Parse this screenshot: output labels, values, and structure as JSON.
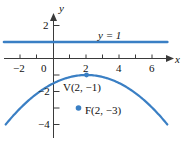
{
  "figure": {
    "colors": {
      "curve": "#3a7fc4",
      "line": "#3a7fc4",
      "point": "#3a7fc4",
      "axis": "#3a3a3a",
      "text": "#111111",
      "background": "#ffffff"
    }
  },
  "axes": {
    "x_axis_label": "x",
    "y_axis_label": "y",
    "x_ticks": [
      {
        "value": -2,
        "label": "−2"
      },
      {
        "value": -1,
        "label": ""
      },
      {
        "value": 0,
        "label": "0"
      },
      {
        "value": 1,
        "label": ""
      },
      {
        "value": 2,
        "label": "2"
      },
      {
        "value": 3,
        "label": ""
      },
      {
        "value": 4,
        "label": "4"
      },
      {
        "value": 5,
        "label": ""
      },
      {
        "value": 6,
        "label": "6"
      }
    ],
    "y_ticks": [
      {
        "value": 2,
        "label": "2"
      },
      {
        "value": 1,
        "label": ""
      },
      {
        "value": -1,
        "label": ""
      },
      {
        "value": -2,
        "label": "−2"
      },
      {
        "value": -3,
        "label": ""
      },
      {
        "value": -4,
        "label": "−4"
      }
    ],
    "x_range": [
      -3.2,
      7.0
    ],
    "y_range": [
      -5.0,
      2.8
    ],
    "origin_label": "0"
  },
  "annotations": {
    "directrix_label": "y = 1",
    "vertex_label": "V(2, −1)",
    "focus_label": "F(2, −3)"
  },
  "chart_data": {
    "type": "line",
    "title": "",
    "xlabel": "x",
    "ylabel": "y",
    "xlim": [
      -3.2,
      7.0
    ],
    "ylim": [
      -5.0,
      2.8
    ],
    "grid": false,
    "legend": "none",
    "series": [
      {
        "name": "y = 1",
        "kind": "horizontal-line",
        "equation": "y = 1",
        "y": 1,
        "x_start": -3.0,
        "x_end": 6.9,
        "color": "#3a7fc4"
      },
      {
        "name": "parabola",
        "kind": "parabola",
        "equation": "x^2 - 4x + 8y + 12 = 0",
        "vertex": [
          2,
          -1
        ],
        "focus": [
          2,
          -3
        ],
        "directrix": "y = 1",
        "opens": "down",
        "a": -0.125,
        "x_start": -2.9,
        "x_end": 6.9,
        "color": "#3a7fc4",
        "points": [
          {
            "x": -3.0,
            "y": -4.125
          },
          {
            "x": -2.0,
            "y": -3.0
          },
          {
            "x": -1.0,
            "y": -2.125
          },
          {
            "x": 0.0,
            "y": -1.5
          },
          {
            "x": 1.0,
            "y": -1.125
          },
          {
            "x": 2.0,
            "y": -1.0
          },
          {
            "x": 3.0,
            "y": -1.125
          },
          {
            "x": 4.0,
            "y": -1.5
          },
          {
            "x": 5.0,
            "y": -2.125
          },
          {
            "x": 6.0,
            "y": -3.0
          },
          {
            "x": 6.9,
            "y": -4.0
          }
        ]
      }
    ],
    "points": [
      {
        "name": "vertex",
        "label": "V(2, −1)",
        "x": 2,
        "y": -1,
        "color": "#3a7fc4"
      },
      {
        "name": "focus",
        "label": "F(2, −3)",
        "x": 2,
        "y": -3,
        "color": "#3a7fc4"
      }
    ]
  }
}
